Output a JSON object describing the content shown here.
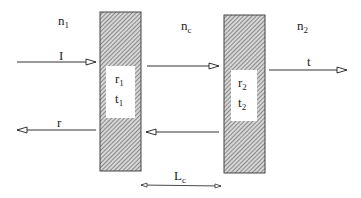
{
  "diagram": {
    "media": {
      "left": {
        "base": "n",
        "sub": "1"
      },
      "cavity": {
        "base": "n",
        "sub": "c"
      },
      "right": {
        "base": "n",
        "sub": "2"
      }
    },
    "mirrors": [
      {
        "id": "mirror-1",
        "r": {
          "base": "r",
          "sub": "1"
        },
        "t": {
          "base": "t",
          "sub": "1"
        }
      },
      {
        "id": "mirror-2",
        "r": {
          "base": "r",
          "sub": "2"
        },
        "t": {
          "base": "t",
          "sub": "2"
        }
      }
    ],
    "beams": {
      "incident": "I",
      "reflected": "r",
      "transmitted": "t"
    },
    "cavity_length": {
      "base": "L",
      "sub": "c"
    }
  },
  "colors": {
    "line": "#333333",
    "hatch_dark": "#555555",
    "hatch_light": "#cfcfcf",
    "mirror_border": "#444444",
    "background": "#ffffff"
  }
}
